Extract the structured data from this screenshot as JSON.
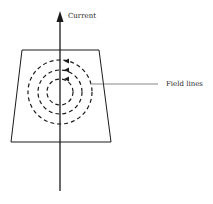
{
  "diagram": {
    "type": "magnetic-field-around-current-carrying-wire",
    "labels": {
      "current": "Current",
      "field_lines": "Field lines"
    },
    "colors": {
      "stroke": "#1a1a1a",
      "background": "#ffffff"
    },
    "wire": {
      "x": 60,
      "top": 12,
      "bottom": 191,
      "direction": "up"
    },
    "plane": {
      "top_left": [
        22,
        50
      ],
      "top_right": [
        99,
        50
      ],
      "bottom_right": [
        111,
        142
      ],
      "bottom_left": [
        11,
        142
      ]
    },
    "field_circles": {
      "center": [
        60,
        92
      ],
      "radii": [
        13,
        22,
        32
      ],
      "style": "dashed",
      "direction": "counterclockwise"
    }
  }
}
